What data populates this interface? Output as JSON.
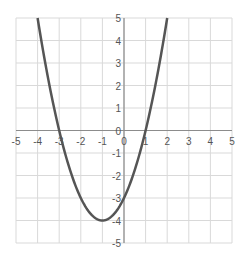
{
  "chart_data": {
    "type": "line",
    "title": "",
    "xlabel": "",
    "ylabel": "",
    "function": "y = x^2 + 2x - 3",
    "xlim": [
      -5,
      5
    ],
    "ylim": [
      -5,
      5
    ],
    "grid": true,
    "x_ticks": [
      "-5",
      "-4",
      "-3",
      "-2",
      "-1",
      "0",
      "1",
      "2",
      "3",
      "4",
      "5"
    ],
    "y_ticks": [
      "5",
      "4",
      "3",
      "2",
      "1",
      "0",
      "-1",
      "-2",
      "-3",
      "-4",
      "-5"
    ],
    "series": [
      {
        "name": "parabola",
        "color": "#555555",
        "x": [
          -4.0,
          -3.5,
          -3.0,
          -2.5,
          -2.0,
          -1.5,
          -1.0,
          -0.5,
          0.0,
          0.5,
          1.0,
          1.5,
          2.0
        ],
        "y": [
          5.0,
          2.25,
          0.0,
          -1.75,
          -3.0,
          -3.75,
          -4.0,
          -3.75,
          -3.0,
          -1.75,
          0.0,
          2.25,
          5.0
        ]
      }
    ],
    "key_points": {
      "vertex": [
        -1,
        -4
      ],
      "roots": [
        -3,
        1
      ],
      "y_intercept": -3
    }
  },
  "colors": {
    "grid": "#d9d9d9",
    "axis": "#8c8c8c",
    "curve": "#555555",
    "tick_text": "#555555"
  }
}
